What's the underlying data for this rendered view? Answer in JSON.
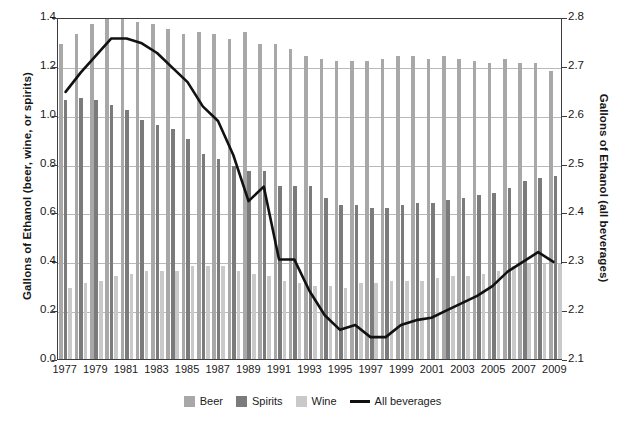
{
  "chart_data": {
    "type": "bar",
    "title": "",
    "subtitle": "",
    "xlabel": "",
    "ylabel": "Gallons of Ethanol (beer, wine, or spirits)",
    "y2label": "Gallons of Ethanol (all beverages)",
    "ylim": [
      0.0,
      1.4
    ],
    "y2lim": [
      2.1,
      2.8
    ],
    "grid": true,
    "legend_position": "bottom",
    "yticks": [
      "0.0",
      "0.2",
      "0.4",
      "0.6",
      "0.8",
      "1.0",
      "1.2",
      "1.4"
    ],
    "ytick_values": [
      0.0,
      0.2,
      0.4,
      0.6,
      0.8,
      1.0,
      1.2,
      1.4
    ],
    "y2ticks": [
      "2.1",
      "2.2",
      "2.3",
      "2.4",
      "2.5",
      "2.6",
      "2.7",
      "2.8"
    ],
    "y2tick_values": [
      2.1,
      2.2,
      2.3,
      2.4,
      2.5,
      2.6,
      2.7,
      2.8
    ],
    "categories": [
      1977,
      1978,
      1979,
      1980,
      1981,
      1982,
      1983,
      1984,
      1985,
      1986,
      1987,
      1988,
      1989,
      1990,
      1991,
      1992,
      1993,
      1994,
      1995,
      1996,
      1997,
      1998,
      1999,
      2000,
      2001,
      2002,
      2003,
      2004,
      2005,
      2006,
      2007,
      2008,
      2009
    ],
    "xtick_labels": [
      "1977",
      "1979",
      "1981",
      "1983",
      "1985",
      "1987",
      "1989",
      "1991",
      "1993",
      "1995",
      "1997",
      "1999",
      "2001",
      "2003",
      "2005",
      "2007",
      "2009"
    ],
    "series": [
      {
        "name": "Beer",
        "axis": "left",
        "color": "#a8a8a8",
        "values": [
          1.29,
          1.33,
          1.37,
          1.39,
          1.39,
          1.38,
          1.37,
          1.35,
          1.33,
          1.34,
          1.33,
          1.31,
          1.34,
          1.29,
          1.29,
          1.27,
          1.24,
          1.23,
          1.22,
          1.22,
          1.22,
          1.23,
          1.24,
          1.24,
          1.23,
          1.24,
          1.23,
          1.22,
          1.21,
          1.23,
          1.21,
          1.21,
          1.18
        ]
      },
      {
        "name": "Spirits",
        "axis": "left",
        "color": "#7b7b7b",
        "values": [
          1.06,
          1.07,
          1.06,
          1.04,
          1.02,
          0.98,
          0.96,
          0.94,
          0.9,
          0.84,
          0.82,
          0.79,
          0.77,
          0.77,
          0.71,
          0.71,
          0.71,
          0.66,
          0.63,
          0.63,
          0.62,
          0.62,
          0.63,
          0.64,
          0.64,
          0.65,
          0.66,
          0.67,
          0.68,
          0.7,
          0.73,
          0.74,
          0.75
        ]
      },
      {
        "name": "Wine",
        "axis": "left",
        "color": "#c9c9c9",
        "values": [
          0.29,
          0.31,
          0.32,
          0.34,
          0.35,
          0.36,
          0.36,
          0.36,
          0.38,
          0.38,
          0.38,
          0.36,
          0.35,
          0.34,
          0.32,
          0.31,
          0.3,
          0.3,
          0.29,
          0.31,
          0.31,
          0.32,
          0.32,
          0.32,
          0.33,
          0.34,
          0.34,
          0.35,
          0.36,
          0.38,
          0.39,
          0.39,
          0.39
        ]
      },
      {
        "name": "All beverages",
        "axis": "right",
        "type": "line",
        "color": "#111111",
        "values": [
          2.64,
          2.68,
          2.72,
          2.76,
          2.76,
          2.75,
          2.73,
          2.7,
          2.67,
          2.62,
          2.59,
          2.52,
          2.43,
          2.46,
          2.31,
          2.31,
          2.24,
          2.19,
          2.16,
          2.17,
          2.15,
          2.15,
          2.17,
          2.18,
          2.19,
          2.2,
          2.21,
          2.23,
          2.25,
          2.28,
          2.3,
          2.32,
          2.3
        ],
        "values_left_scale": [
          1.1,
          1.18,
          1.25,
          1.32,
          1.32,
          1.3,
          1.26,
          1.2,
          1.14,
          1.04,
          0.98,
          0.84,
          0.65,
          0.71,
          0.41,
          0.41,
          0.28,
          0.18,
          0.12,
          0.14,
          0.09,
          0.09,
          0.14,
          0.16,
          0.17,
          0.2,
          0.23,
          0.26,
          0.3,
          0.36,
          0.4,
          0.44,
          0.4
        ]
      }
    ],
    "legend": [
      {
        "label": "Beer",
        "color": "#a8a8a8",
        "marker": "square"
      },
      {
        "label": "Spirits",
        "color": "#7b7b7b",
        "marker": "square"
      },
      {
        "label": "Wine",
        "color": "#c9c9c9",
        "marker": "square"
      },
      {
        "label": "All beverages",
        "color": "#111111",
        "marker": "line"
      }
    ]
  }
}
